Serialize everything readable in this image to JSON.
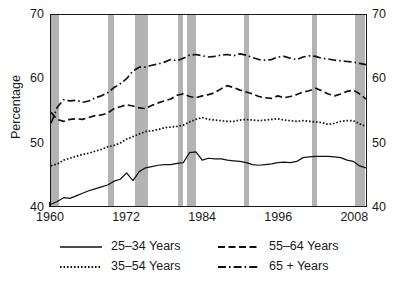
{
  "chart_data": {
    "type": "line",
    "title": "",
    "xlabel": "",
    "ylabel": "Percentage",
    "ylabel_right": "Percentage",
    "xlim": [
      1960,
      2010
    ],
    "ylim": [
      40,
      70
    ],
    "grid": false,
    "legend_position": "below",
    "y_ticks": [
      "70",
      "60",
      "50",
      "40"
    ],
    "y_tick_values": [
      70,
      60,
      50,
      40
    ],
    "x_ticks": [
      "1960",
      "1972",
      "1984",
      "1996",
      "2008"
    ],
    "x_tick_values": [
      1960,
      1972,
      1984,
      1996,
      2008
    ],
    "x_minor_tick_values": [
      1963,
      1966,
      1969,
      1975,
      1978,
      1981,
      1987,
      1990,
      1993,
      1999,
      2002,
      2005
    ],
    "shaded_band_color": "#b3b3b3",
    "shaded_bands": [
      {
        "start": 1960.0,
        "end": 1961.3
      },
      {
        "start": 1969.0,
        "end": 1970.0
      },
      {
        "start": 1973.3,
        "end": 1975.3
      },
      {
        "start": 1980.0,
        "end": 1980.8
      },
      {
        "start": 1981.5,
        "end": 1982.9
      },
      {
        "start": 1990.5,
        "end": 1991.3
      },
      {
        "start": 2001.1,
        "end": 2001.9
      },
      {
        "start": 2007.9,
        "end": 2009.5
      }
    ],
    "series": [
      {
        "name": "25–34 Years",
        "style": "solid",
        "x": [
          1960,
          1961,
          1962,
          1963,
          1964,
          1965,
          1966,
          1967,
          1968,
          1969,
          1970,
          1971,
          1972,
          1973,
          1974,
          1975,
          1976,
          1977,
          1978,
          1979,
          1980,
          1981,
          1982,
          1983,
          1984,
          1985,
          1986,
          1987,
          1988,
          1989,
          1990,
          1991,
          1992,
          1993,
          1994,
          1995,
          1996,
          1997,
          1998,
          1999,
          2000,
          2001,
          2002,
          2003,
          2004,
          2005,
          2006,
          2007,
          2008,
          2009,
          2010
        ],
        "values": [
          40.3,
          40.7,
          41.3,
          41.2,
          41.6,
          42.0,
          42.4,
          42.7,
          43.0,
          43.3,
          43.9,
          44.2,
          45.2,
          44.0,
          45.4,
          46.0,
          46.2,
          46.4,
          46.5,
          46.5,
          46.7,
          46.8,
          48.4,
          48.5,
          47.2,
          47.5,
          47.4,
          47.4,
          47.2,
          47.1,
          47.0,
          46.8,
          46.5,
          46.4,
          46.5,
          46.6,
          46.8,
          46.9,
          46.8,
          47.0,
          47.6,
          47.7,
          47.8,
          47.8,
          47.8,
          47.7,
          47.6,
          47.2,
          47.0,
          46.3,
          46.0
        ]
      },
      {
        "name": "35–54 Years",
        "style": "dotted",
        "x": [
          1960,
          1961,
          1962,
          1963,
          1964,
          1965,
          1966,
          1967,
          1968,
          1969,
          1970,
          1971,
          1972,
          1973,
          1974,
          1975,
          1976,
          1977,
          1978,
          1979,
          1980,
          1981,
          1982,
          1983,
          1984,
          1985,
          1986,
          1987,
          1988,
          1989,
          1990,
          1991,
          1992,
          1993,
          1994,
          1995,
          1996,
          1997,
          1998,
          1999,
          2000,
          2001,
          2002,
          2003,
          2004,
          2005,
          2006,
          2007,
          2008,
          2009,
          2010
        ],
        "values": [
          46.3,
          46.6,
          47.2,
          47.5,
          47.8,
          48.1,
          48.3,
          48.6,
          48.9,
          49.3,
          49.5,
          49.9,
          50.5,
          50.9,
          51.3,
          51.7,
          51.8,
          52.0,
          52.3,
          52.4,
          52.5,
          52.7,
          53.2,
          53.6,
          53.9,
          53.6,
          53.5,
          53.4,
          53.3,
          53.3,
          53.5,
          53.6,
          53.5,
          53.4,
          53.5,
          53.6,
          53.7,
          53.5,
          53.4,
          53.3,
          53.4,
          53.3,
          53.2,
          53.1,
          52.8,
          53.0,
          53.3,
          53.4,
          53.4,
          52.9,
          52.5
        ]
      },
      {
        "name": "55–64 Years",
        "style": "dashed",
        "x": [
          1960,
          1961,
          1962,
          1963,
          1964,
          1965,
          1966,
          1967,
          1968,
          1969,
          1970,
          1971,
          1972,
          1973,
          1974,
          1975,
          1976,
          1977,
          1978,
          1979,
          1980,
          1981,
          1982,
          1983,
          1984,
          1985,
          1986,
          1987,
          1988,
          1989,
          1990,
          1991,
          1992,
          1993,
          1994,
          1995,
          1996,
          1997,
          1998,
          1999,
          2000,
          2001,
          2002,
          2003,
          2004,
          2005,
          2006,
          2007,
          2008,
          2009,
          2010
        ],
        "values": [
          54.7,
          53.6,
          53.3,
          53.6,
          53.7,
          53.6,
          53.9,
          54.2,
          54.3,
          54.6,
          55.3,
          55.6,
          55.9,
          55.7,
          55.4,
          55.3,
          55.8,
          56.2,
          56.5,
          56.8,
          57.4,
          57.6,
          57.2,
          57.0,
          57.3,
          57.5,
          57.8,
          58.4,
          58.9,
          58.6,
          58.2,
          57.9,
          57.6,
          57.2,
          57.0,
          56.9,
          57.3,
          57.0,
          57.2,
          57.5,
          57.9,
          58.1,
          58.5,
          58.1,
          57.6,
          57.3,
          57.6,
          58.0,
          58.2,
          57.6,
          56.8
        ]
      },
      {
        "name": "65 + Years",
        "style": "dashdot",
        "x": [
          1960,
          1961,
          1962,
          1963,
          1964,
          1965,
          1966,
          1967,
          1968,
          1969,
          1970,
          1971,
          1972,
          1973,
          1974,
          1975,
          1976,
          1977,
          1978,
          1979,
          1980,
          1981,
          1982,
          1983,
          1984,
          1985,
          1986,
          1987,
          1988,
          1989,
          1990,
          1991,
          1992,
          1993,
          1994,
          1995,
          1996,
          1997,
          1998,
          1999,
          2000,
          2001,
          2002,
          2003,
          2004,
          2005,
          2006,
          2007,
          2008,
          2009,
          2010
        ],
        "values": [
          53.0,
          55.5,
          56.7,
          56.5,
          56.6,
          56.3,
          56.5,
          57.0,
          57.3,
          57.8,
          58.6,
          59.2,
          60.0,
          61.2,
          61.8,
          61.8,
          62.1,
          62.3,
          62.6,
          63.0,
          62.8,
          63.2,
          63.7,
          63.8,
          63.6,
          63.4,
          63.5,
          63.7,
          63.8,
          63.6,
          63.9,
          63.7,
          63.3,
          63.0,
          62.9,
          63.0,
          63.4,
          63.5,
          63.2,
          63.0,
          63.4,
          63.6,
          63.5,
          63.2,
          63.1,
          62.9,
          62.8,
          62.7,
          62.6,
          62.4,
          62.2
        ]
      }
    ],
    "legend_entries": [
      {
        "label": "25–34 Years",
        "style": "solid"
      },
      {
        "label": "35–54 Years",
        "style": "dotted"
      },
      {
        "label": "55–64 Years",
        "style": "dashed"
      },
      {
        "label": "65 + Years",
        "style": "dashdot"
      }
    ]
  }
}
